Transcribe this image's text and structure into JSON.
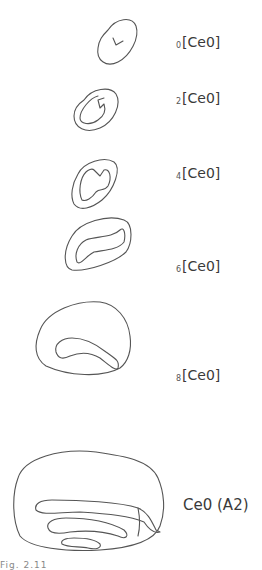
{
  "figure": {
    "stages": [
      {
        "subscript": "0",
        "name": "[Ce0]"
      },
      {
        "subscript": "2",
        "name": "[Ce0]"
      },
      {
        "subscript": "4",
        "name": "[Ce0]"
      },
      {
        "subscript": "6",
        "name": "[Ce0]"
      },
      {
        "subscript": "8",
        "name": "[Ce0]"
      }
    ],
    "final_label": "Ce0  (A2)",
    "caption": "Fig. 2.11"
  },
  "colors": {
    "stroke": "#555555",
    "text": "#3a3a3a",
    "background": "#ffffff"
  }
}
